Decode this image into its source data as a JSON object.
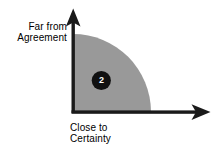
{
  "diagram": {
    "type": "quadrant-certainty-agreement",
    "background_color": "#ffffff",
    "axes": {
      "origin": {
        "x": 73,
        "y": 112
      },
      "line_color": "#1a1a1a",
      "y_axis": {
        "name": "far-from-agreement-axis",
        "label_lines": [
          "Far from",
          "Agreement"
        ],
        "direction": "up",
        "tip": {
          "x": 73,
          "y": 9
        }
      },
      "x_axis": {
        "name": "close-to-certainty-axis",
        "label_lines": [
          "Close to",
          "Certainty"
        ],
        "direction": "right",
        "tip": {
          "x": 210,
          "y": 112
        }
      }
    },
    "region": {
      "name": "shaded-quarter-circle",
      "shape": "quarter-circle",
      "fill_color": "#999999",
      "radius": 78
    },
    "marker": {
      "name": "region-marker-2",
      "label": "2",
      "shape": "circle",
      "fill_color": "#111111",
      "text_color": "#ffffff",
      "center": {
        "x": 101,
        "y": 80
      },
      "radius": 9.5
    }
  }
}
